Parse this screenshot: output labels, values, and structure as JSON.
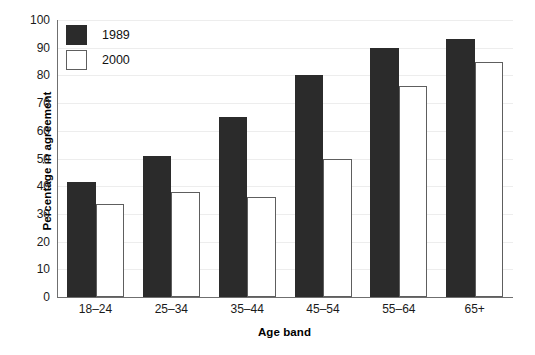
{
  "chart_data": {
    "type": "bar",
    "title": "",
    "subtitle": "",
    "xlabel": "Age band",
    "ylabel": "Percentage in agreement",
    "categories": [
      "18–24",
      "25–34",
      "35–44",
      "45–54",
      "55–64",
      "65+"
    ],
    "series": [
      {
        "name": "1989",
        "color": "#2b2b2b",
        "values": [
          41.5,
          51,
          65,
          80,
          90,
          93
        ]
      },
      {
        "name": "2000",
        "color": "#ffffff",
        "values": [
          33.5,
          38,
          36,
          50,
          76,
          85
        ]
      }
    ],
    "ylim": [
      0,
      100
    ],
    "ytick_step": 10,
    "yticks": [
      100,
      90,
      80,
      70,
      60,
      50,
      40,
      30,
      20,
      10,
      0
    ],
    "ytick_labels": [
      "100",
      "90",
      "80",
      "70",
      "60",
      "50",
      "40",
      "30",
      "20",
      "10",
      "0"
    ],
    "grid": "horizontal",
    "grid_color": "#ededed",
    "legend_position": "top-left",
    "axis_color": "#6f6f6f",
    "background": "#ffffff"
  },
  "legend": {
    "entries": [
      {
        "label": "1989"
      },
      {
        "label": "2000"
      }
    ]
  }
}
